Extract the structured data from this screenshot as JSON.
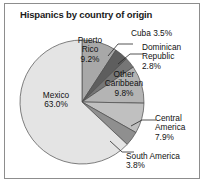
{
  "frame": {
    "border_color": "#8d8d8d",
    "background": "#ffffff"
  },
  "header": {
    "title": "Hispanics by country of origin"
  },
  "chart_data": {
    "type": "pie",
    "title": "Hispanics by country of origin",
    "xlabel": "",
    "ylabel": "",
    "units": "percent",
    "start_angle_deg": 0,
    "direction": "clockwise",
    "center": {
      "x": 82,
      "y": 102
    },
    "radius": 62,
    "categories": [
      "Puerto Rico",
      "Cuba",
      "Dominican Republic",
      "Other Caribbean",
      "Central America",
      "South America",
      "Mexico"
    ],
    "values": [
      9.2,
      3.5,
      2.8,
      9.8,
      7.9,
      3.8,
      63.0
    ],
    "slices": [
      {
        "name": "Puerto Rico",
        "value": 9.2,
        "label": "Puerto\nRico\n9.2%",
        "display": "9.2%",
        "color": "#a8a8a8",
        "label_pos": "inside"
      },
      {
        "name": "Cuba",
        "value": 3.5,
        "label": "Cuba 3.5%",
        "display": "3.5%",
        "color": "#5e5e5e",
        "label_pos": "outside"
      },
      {
        "name": "Dominican Republic",
        "value": 2.8,
        "label": "Dominican\nRepublic\n2.8%",
        "display": "2.8%",
        "color": "#767676",
        "label_pos": "outside"
      },
      {
        "name": "Other Caribbean",
        "value": 9.8,
        "label": "Other\nCaribbean\n9.8%",
        "display": "9.8%",
        "color": "#b4b4b4",
        "label_pos": "inside"
      },
      {
        "name": "Central America",
        "value": 7.9,
        "label": "Central\nAmerica\n7.9%",
        "display": "7.9%",
        "color": "#c0c0c0",
        "label_pos": "outside"
      },
      {
        "name": "South America",
        "value": 3.8,
        "label": "South America\n3.8%",
        "display": "3.8%",
        "color": "#8f8f8f",
        "label_pos": "outside"
      },
      {
        "name": "Mexico",
        "value": 63.0,
        "label": "Mexico\n63.0%",
        "display": "63.0%",
        "color": "#e4e4e4",
        "label_pos": "inside"
      }
    ],
    "legend": "none",
    "grid": false
  },
  "labels": {
    "puerto_rico_name": "Puerto",
    "puerto_rico_name2": "Rico",
    "puerto_rico_value": "9.2%",
    "cuba": "Cuba 3.5%",
    "dominican_1": "Dominican",
    "dominican_2": "Republic",
    "dominican_value": "2.8%",
    "other_caribbean_1": "Other",
    "other_caribbean_2": "Caribbean",
    "other_caribbean_value": "9.8%",
    "mexico_name": "Mexico",
    "mexico_value": "63.0%",
    "central_america_1": "Central",
    "central_america_2": "America",
    "central_america_value": "7.9%",
    "south_america": "South America",
    "south_america_value": "3.8%"
  }
}
